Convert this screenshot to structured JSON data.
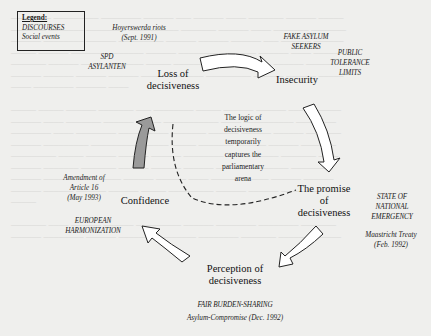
{
  "legend": {
    "title": "Legend:",
    "items": [
      "DISCOURSES",
      "Social events"
    ]
  },
  "nodes": {
    "loss": [
      "Loss of",
      "decisiveness"
    ],
    "insecurity": [
      "Insecurity"
    ],
    "promise": [
      "The promise",
      "of",
      "decisiveness"
    ],
    "perception": [
      "Perception of",
      "decisiveness"
    ],
    "confidence": [
      "Confidence"
    ]
  },
  "center": [
    "The logic of",
    "decisiveness",
    "temporarily",
    "captures the",
    "parliamentary",
    "arena"
  ],
  "annotations": {
    "hoyerswerda": [
      "Hoyerswerda riots",
      "(Sept. 1991)"
    ],
    "spd": [
      "SPD",
      "ASYLANTEN"
    ],
    "fake_asylum": [
      "FAKE ASYLUM",
      "SEEKERS"
    ],
    "public_tolerance": [
      "PUBLIC",
      "TOLERANCE",
      "LIMITS"
    ],
    "state_emergency": [
      "STATE OF",
      "NATIONAL",
      "EMERGENCY"
    ],
    "maastricht": [
      "Maastricht Treaty",
      "(Feb. 1992)"
    ],
    "fair_burden": [
      "FAIR BURDEN-SHARING"
    ],
    "asylum_compromise": [
      "Asylum-Compromise (Dec. 1992)"
    ],
    "amendment": [
      "Amendment of",
      "Article 16",
      "(May 1993)"
    ],
    "european": [
      "EUROPEAN",
      "HARMONIZATION"
    ]
  },
  "colors": {
    "background": "#efefed",
    "arrow_fill": "#ffffff",
    "highlight_arrow_fill": "#9a9a9a",
    "stroke": "#222222"
  }
}
